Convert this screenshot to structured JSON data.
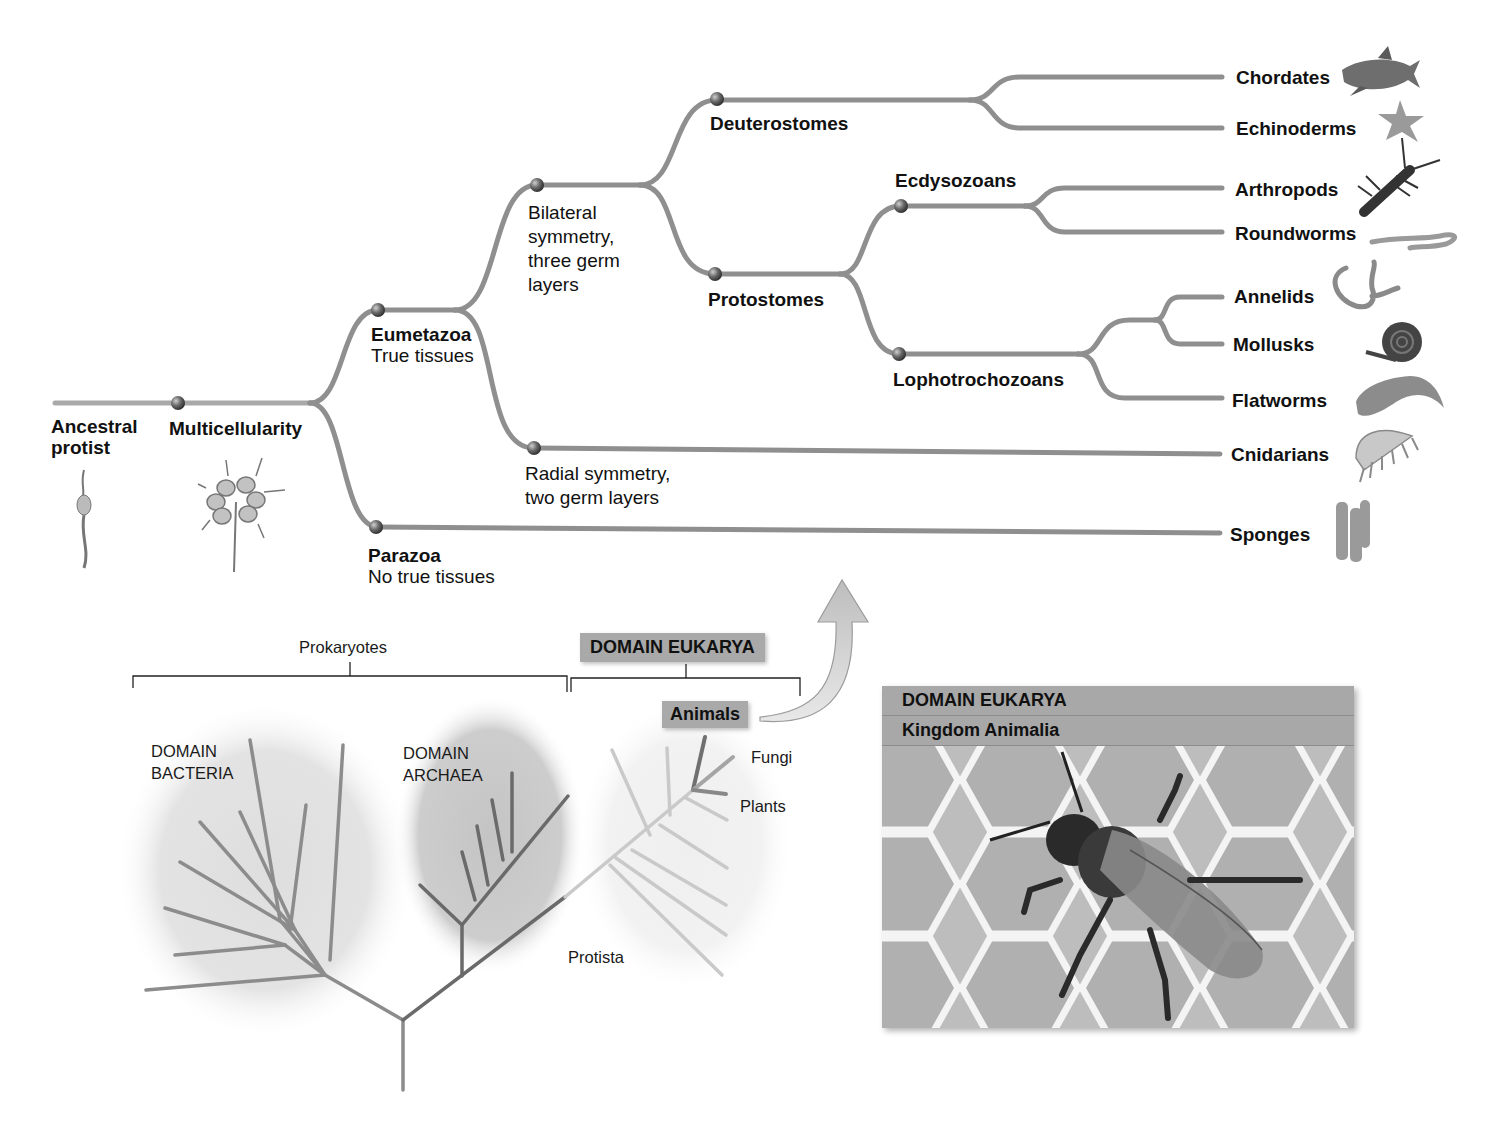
{
  "tree": {
    "root": {
      "label": "Ancestral protist",
      "line1": "Ancestral",
      "line2": "protist"
    },
    "nodes": {
      "multicellularity": {
        "label": "Multicellularity"
      },
      "eumetazoa": {
        "label": "Eumetazoa",
        "description": "True tissues"
      },
      "parazoa": {
        "label": "Parazoa",
        "description": "No true tissues"
      },
      "bilateria": {
        "description_lines": [
          "Bilateral",
          "symmetry,",
          "three germ",
          "layers"
        ]
      },
      "radiata": {
        "description_lines": [
          "Radial symmetry,",
          "two germ layers"
        ]
      },
      "deuterostomes": {
        "label": "Deuterostomes"
      },
      "protostomes": {
        "label": "Protostomes"
      },
      "ecdysozoans": {
        "label": "Ecdysozoans"
      },
      "lophotrochozoans": {
        "label": "Lophotrochozoans"
      }
    },
    "tips": [
      {
        "label": "Chordates",
        "icon": "shark-icon"
      },
      {
        "label": "Echinoderms",
        "icon": "sea-star-icon"
      },
      {
        "label": "Arthropods",
        "icon": "lobster-icon"
      },
      {
        "label": "Roundworms",
        "icon": "roundworm-icon"
      },
      {
        "label": "Annelids",
        "icon": "earthworm-icon"
      },
      {
        "label": "Mollusks",
        "icon": "snail-icon"
      },
      {
        "label": "Flatworms",
        "icon": "flatworm-icon"
      },
      {
        "label": "Cnidarians",
        "icon": "jellyfish-icon"
      },
      {
        "label": "Sponges",
        "icon": "sponge-icon"
      }
    ],
    "illustrations": {
      "ancestral_protist": "choanoflagellate-icon",
      "multicellularity": "colonial-protist-icon"
    },
    "colors": {
      "branch": "#8f8f8f",
      "node": "#555555"
    }
  },
  "lower_tree": {
    "groups": {
      "prokaryotes": "Prokaryotes",
      "eukarya": "DOMAIN EUKARYA"
    },
    "domains": {
      "bacteria": {
        "line1": "DOMAIN",
        "line2": "BACTERIA"
      },
      "archaea": {
        "line1": "DOMAIN",
        "line2": "ARCHAEA"
      }
    },
    "labels": {
      "animals": "Animals",
      "fungi": "Fungi",
      "plants": "Plants",
      "protista": "Protista"
    }
  },
  "photo_panel": {
    "domain": "DOMAIN EUKARYA",
    "kingdom": "Kingdom Animalia",
    "subject": "honeybee-on-honeycomb"
  }
}
